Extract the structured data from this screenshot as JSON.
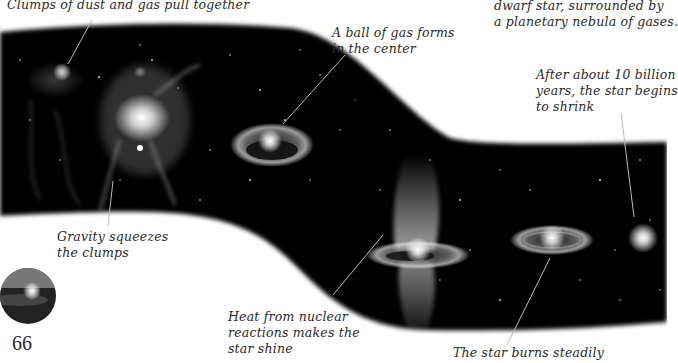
{
  "page": {
    "number": "66"
  },
  "captions": {
    "clumps": "Clumps of dust and gas pull together",
    "ball_line1": "A ball of gas forms",
    "ball_line2": "in the center",
    "dwarf_line1": "dwarf star, surrounded by",
    "dwarf_line2": "a planetary nebula of gases.",
    "shrink_line1": "After about 10 billion",
    "shrink_line2": "years, the star begins",
    "shrink_line3": "to shrink",
    "gravity_line1": "Gravity squeezes",
    "gravity_line2": "the clumps",
    "heat_line1": "Heat from nuclear",
    "heat_line2": "reactions makes the",
    "heat_line3": "star shine",
    "steady": "The star burns steadily"
  },
  "illustration": {
    "subject": "star life cycle band",
    "stages": [
      "dust-clumps",
      "nebula",
      "protostar",
      "star-ignition",
      "main-sequence-star",
      "shrinking-star"
    ],
    "band_color": "#000000",
    "glow_color": "#ffffff"
  }
}
